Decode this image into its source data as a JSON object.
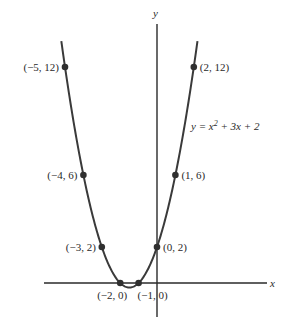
{
  "chart_data": {
    "type": "line",
    "title": "",
    "equation": "y = x^2 + 3x + 2",
    "equation_display": {
      "prefix": "y = x",
      "sup": "2",
      "suffix": " + 3x + 2"
    },
    "xlabel": "x",
    "ylabel": "y",
    "xlim": [
      -6.1,
      6.0
    ],
    "ylim": [
      -1.9,
      14.3
    ],
    "grid": false,
    "legend": "none",
    "series": [
      {
        "name": "y = x^2 + 3x + 2",
        "x_range": [
          -5.2,
          2.2
        ],
        "points": [
          {
            "x": -5,
            "y": 12,
            "label": "(−5, 12)"
          },
          {
            "x": -4,
            "y": 6,
            "label": "(−4, 6)"
          },
          {
            "x": -3,
            "y": 2,
            "label": "(−3, 2)"
          },
          {
            "x": -2,
            "y": 0,
            "label": "(−2, 0)"
          },
          {
            "x": -1,
            "y": 0,
            "label": "(−1, 0)"
          },
          {
            "x": 0,
            "y": 2,
            "label": "(0, 2)"
          },
          {
            "x": 1,
            "y": 6,
            "label": "(1, 6)"
          },
          {
            "x": 2,
            "y": 12,
            "label": "(2, 12)"
          }
        ]
      }
    ]
  },
  "colors": {
    "curve": "#3a3a3a",
    "axis": "#2a2a2a",
    "text": "#2a2a2a",
    "background": "#ffffff"
  }
}
